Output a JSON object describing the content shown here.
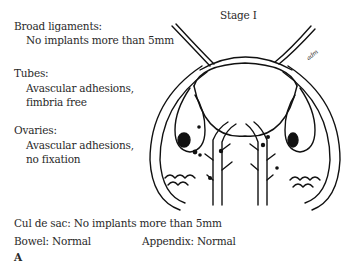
{
  "figure": {
    "stage_title": "Stage I",
    "panel_label": "A",
    "signature": "adm"
  },
  "annotations": {
    "broad_ligaments": {
      "label": "Broad ligaments:",
      "lines": [
        "No implants more than 5mm"
      ]
    },
    "tubes": {
      "label": "Tubes:",
      "lines": [
        "Avascular adhesions,",
        "fimbria free"
      ]
    },
    "ovaries": {
      "label": "Ovaries:",
      "lines": [
        "Avascular adhesions,",
        "no fixation"
      ]
    },
    "cul_de_sac": "Cul de sac: No implants more than 5mm",
    "bowel": "Bowel: Normal",
    "appendix": "Appendix: Normal"
  }
}
